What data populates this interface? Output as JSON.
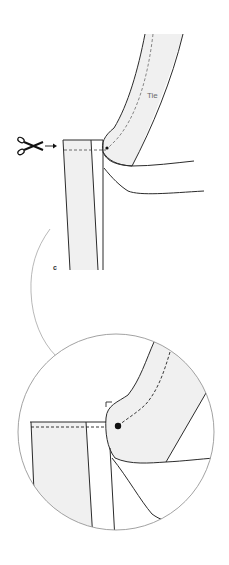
{
  "diagram": {
    "type": "sewing-instruction",
    "labels": {
      "tie": "Tie",
      "step": "c"
    },
    "icons": {
      "cut": "scissors-icon",
      "pointer": "arrow-right-icon"
    },
    "colors": {
      "stroke": "#2b2b2b",
      "fabric_fill": "#f0f0f0",
      "connector": "#9a9a9a",
      "background": "#ffffff"
    },
    "callout": "magnified-detail"
  }
}
